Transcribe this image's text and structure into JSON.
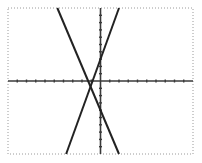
{
  "chart_data": {
    "type": "line",
    "title": "",
    "xlabel": "",
    "ylabel": "",
    "xlim": [
      -10,
      10
    ],
    "ylim": [
      -10,
      10
    ],
    "xscale_ticks": 1,
    "yscale_ticks": 1,
    "grid": false,
    "legend": null,
    "series": [
      {
        "name": "line-1",
        "slope": -3,
        "intercept": -4,
        "x": [
          -4.67,
          2.0
        ],
        "y": [
          10,
          -10
        ],
        "color": "#222222"
      },
      {
        "name": "line-2",
        "slope": 3.5,
        "intercept": 3,
        "x": [
          -3.71,
          2.0
        ],
        "y": [
          -10,
          10
        ],
        "color": "#222222"
      }
    ]
  },
  "colors": {
    "background": "#ffffff",
    "frame": "#9a9a9a",
    "axis": "#3a3a3a",
    "line": "#222222"
  }
}
